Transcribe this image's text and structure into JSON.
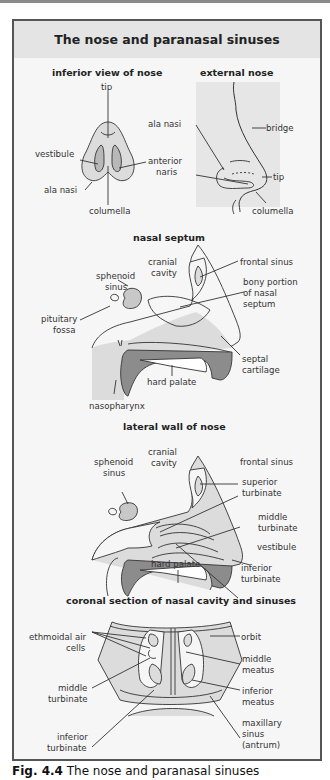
{
  "figure": {
    "title": "The nose and paranasal sinuses",
    "caption_label": "Fig. 4.4",
    "caption_text": "The nose and paranasal sinuses",
    "colors": {
      "panel_bg": "#f6f6f6",
      "header_bg": "#e4e4e4",
      "tissue_fill": "#dcdcdc",
      "dark_fill": "#8c8c8c",
      "border": "#555555"
    }
  },
  "sections": {
    "inferior_view": {
      "title": "inferior view of nose",
      "labels": {
        "tip": "tip",
        "vestibule": "vestibule",
        "ala_nasi": "ala nasi",
        "columella": "columella"
      }
    },
    "external_nose": {
      "title": "external nose",
      "labels": {
        "ala_nasi": "ala nasi",
        "anterior": "anterior",
        "naris": "naris",
        "bridge": "bridge",
        "tip": "tip",
        "columella": "columella"
      }
    },
    "nasal_septum": {
      "title": "nasal septum",
      "labels": {
        "cranial": "cranial",
        "cavity": "cavity",
        "frontal_sinus": "frontal sinus",
        "sphenoid": "sphenoid",
        "sinus": "sinus",
        "bony1": "bony portion",
        "bony2": "of nasal",
        "bony3": "septum",
        "pituitary": "pituitary",
        "fossa": "fossa",
        "septal": "septal",
        "cartilage": "cartilage",
        "hard_palate": "hard palate",
        "nasopharynx": "nasopharynx"
      }
    },
    "lateral_wall": {
      "title": "lateral wall of nose",
      "labels": {
        "cranial": "cranial",
        "cavity": "cavity",
        "frontal_sinus": "frontal sinus",
        "sphenoid": "sphenoid",
        "sinus": "sinus",
        "superior": "superior",
        "superior_t": "turbinate",
        "middle": "middle",
        "middle_t": "turbinate",
        "vestibule": "vestibule",
        "hard_palate": "hard palate",
        "inferior": "inferior",
        "inferior_t": "turbinate"
      }
    },
    "coronal": {
      "title": "coronal section of nasal cavity and sinuses",
      "labels": {
        "ethmoidal1": "ethmoidal air",
        "ethmoidal2": "cells",
        "orbit": "orbit",
        "middle_meatus1": "middle",
        "middle_meatus2": "meatus",
        "middle_turb1": "middle",
        "middle_turb2": "turbinate",
        "inferior_meatus1": "inferior",
        "inferior_meatus2": "meatus",
        "inferior_turb1": "inferior",
        "inferior_turb2": "turbinate",
        "maxillary1": "maxillary",
        "maxillary2": "sinus",
        "maxillary3": "(antrum)"
      }
    }
  }
}
